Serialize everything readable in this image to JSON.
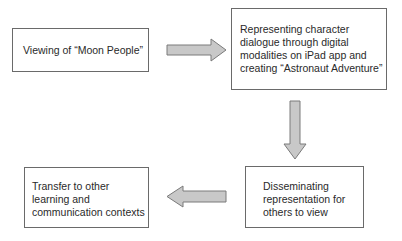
{
  "diagram": {
    "type": "flowchart",
    "colors": {
      "border": "#6a6a6a",
      "arrow_fill": "#c8c8c8",
      "arrow_stroke": "#7a7a7a",
      "text": "#2a2a2a"
    },
    "nodes": [
      {
        "id": "n1",
        "label": "Viewing of “Moon People”"
      },
      {
        "id": "n2",
        "lines": [
          "Representing character",
          "dialogue through digital",
          "modalities on iPad app and",
          "creating “Astronaut Adventure”"
        ]
      },
      {
        "id": "n3",
        "lines": [
          "Disseminating",
          "representation for",
          "others to view"
        ]
      },
      {
        "id": "n4",
        "lines": [
          "Transfer to other",
          "learning and",
          "communication contexts"
        ]
      }
    ],
    "edges": [
      {
        "from": "n1",
        "to": "n2",
        "direction": "right"
      },
      {
        "from": "n2",
        "to": "n3",
        "direction": "down"
      },
      {
        "from": "n3",
        "to": "n4",
        "direction": "left"
      }
    ]
  }
}
